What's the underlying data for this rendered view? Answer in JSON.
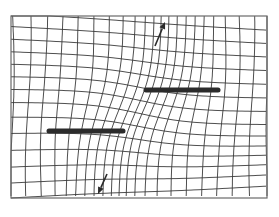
{
  "figure": {
    "title": "",
    "colors": {
      "background": "#ffffff",
      "grid": "#3a3a3a",
      "frame": "#6a6a6a",
      "bar": "#2b2b2b",
      "arrow": "#2b2b2b"
    },
    "frame": {
      "x": 11,
      "y": 16,
      "width": 256,
      "height": 182
    },
    "bars": [
      {
        "name": "upper-fault-segment",
        "x1": 146,
        "y1": 90,
        "x2": 218,
        "y2": 90
      },
      {
        "name": "lower-fault-segment",
        "x1": 49,
        "y1": 131,
        "x2": 123,
        "y2": 131
      }
    ],
    "arrows": [
      {
        "name": "arrow-up",
        "x1": 155,
        "y1": 46,
        "x2": 165,
        "y2": 22
      },
      {
        "name": "arrow-down",
        "x1": 107,
        "y1": 174,
        "x2": 98,
        "y2": 194
      }
    ],
    "grid": {
      "vertical_count": 22,
      "horizontal_count": 14,
      "center_x": 140,
      "center_y": 110
    }
  }
}
